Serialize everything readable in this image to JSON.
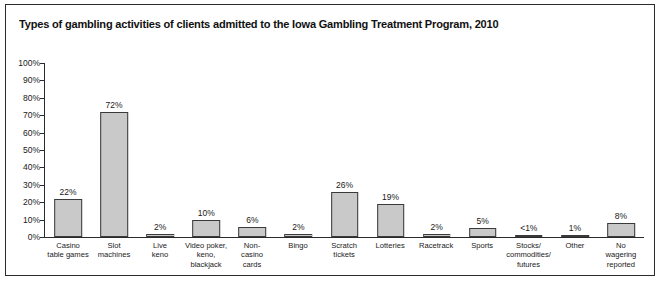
{
  "chart_data": {
    "type": "bar",
    "title": "Types of gambling activities of clients admitted to the Iowa Gambling Treatment Program, 2010",
    "xlabel": "",
    "ylabel": "",
    "ylim": [
      0,
      100
    ],
    "grid": false,
    "legend": "none",
    "y_ticks": [
      "0%",
      "10%",
      "20%",
      "30%",
      "40%",
      "50%",
      "60%",
      "70%",
      "80%",
      "90%",
      "100%"
    ],
    "y_tick_values": [
      0,
      10,
      20,
      30,
      40,
      50,
      60,
      70,
      80,
      90,
      100
    ],
    "categories": [
      "Casino table games",
      "Slot machines",
      "Live keno",
      "Video poker, keno, blackjack",
      "Non-casino cards",
      "Bingo",
      "Scratch tickets",
      "Lotteries",
      "Racetrack",
      "Sports",
      "Stocks/ commodities/ futures",
      "Other",
      "No wagering reported"
    ],
    "category_lines": [
      [
        "Casino",
        "table games"
      ],
      [
        "Slot",
        "machines"
      ],
      [
        "Live",
        "keno"
      ],
      [
        "Video poker,",
        "keno,",
        "blackjack"
      ],
      [
        "Non-",
        "casino",
        "cards"
      ],
      [
        "Bingo"
      ],
      [
        "Scratch",
        "tickets"
      ],
      [
        "Lotteries"
      ],
      [
        "Racetrack"
      ],
      [
        "Sports"
      ],
      [
        "Stocks/",
        "commodities/",
        "futures"
      ],
      [
        "Other"
      ],
      [
        "No",
        "wagering",
        "reported"
      ]
    ],
    "values": [
      22,
      72,
      2,
      10,
      6,
      2,
      26,
      19,
      2,
      5,
      0.4,
      1,
      8
    ],
    "value_labels": [
      "22%",
      "72%",
      "2%",
      "10%",
      "6%",
      "2%",
      "26%",
      "19%",
      "2%",
      "5%",
      "<1%",
      "1%",
      "8%"
    ],
    "colors": {
      "bar_fill": "#c9c9c9",
      "bar_border": "#3a3a3a",
      "axis": "#2b2b2b",
      "text": "#1a1a1a",
      "background": "#ffffff"
    }
  }
}
